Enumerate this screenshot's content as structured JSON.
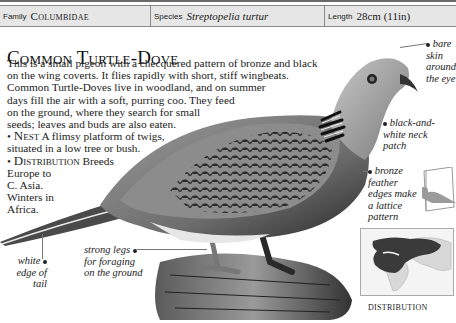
{
  "header": {
    "family_label": "Family",
    "family_value": "Columbidae",
    "species_label": "Species",
    "species_value": "Streptopelia turtur",
    "length_label": "Length",
    "length_value": "28cm (11in)"
  },
  "title": "Common Turtle-Dove",
  "body": {
    "lines": [
      "This is a small pigeon with a checquered pattern of bronze and black",
      "on the wing coverts. It flies rapidly with short, stiff wingbeats.",
      "Common Turtle-Doves live in woodland, and on summer",
      "days fill the air with a soft, purring coo. They feed",
      "on the ground, where they search for small",
      "seeds; leaves and buds are also eaten."
    ],
    "nest_heading": "Nest",
    "nest_text_1": "A flimsy platform of twigs,",
    "nest_text_2": "situated in a low tree or bush.",
    "distribution_heading": "Distribution",
    "distribution_text_1": "Breeds",
    "distribution_lines": [
      "Europe to",
      "C. Asia.",
      "Winters in",
      "Africa."
    ]
  },
  "annotations": {
    "eye": [
      "bare",
      "skin",
      "around",
      "the eye"
    ],
    "neck": [
      "black-and-",
      "white neck",
      "patch"
    ],
    "feather": [
      "bronze",
      "feather",
      "edges make",
      "a lattice",
      "pattern"
    ],
    "tail": [
      "white",
      "edge of",
      "tail"
    ],
    "legs": [
      "strong legs",
      "for foraging",
      "on the ground"
    ]
  },
  "map": {
    "label": "DISTRIBUTION"
  },
  "colors": {
    "header_bg": "#e6e6e6",
    "range": "#3a3a3a",
    "land": "#d8d8d8"
  }
}
